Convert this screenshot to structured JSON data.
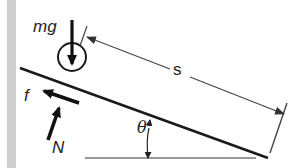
{
  "diagram": {
    "type": "inclined-plane free-body diagram",
    "colors": {
      "ink": "#1a1a1a",
      "dimension_line": "#444444",
      "ground_line": "#777777",
      "margin_band": "#cfcfcf"
    },
    "labels": {
      "weight": "mg",
      "friction": "f",
      "normal": "N",
      "distance": "s",
      "angle": "θ"
    },
    "elements": [
      {
        "id": "ball",
        "kind": "circle",
        "description": "Rolling object on incline"
      },
      {
        "id": "incline",
        "kind": "line",
        "description": "Inclined plane surface"
      },
      {
        "id": "ground",
        "kind": "line",
        "description": "Horizontal reference"
      },
      {
        "id": "weight-arrow",
        "kind": "arrow",
        "label": "mg",
        "direction": "down"
      },
      {
        "id": "friction-arrow",
        "kind": "arrow",
        "label": "f",
        "direction": "up-slope"
      },
      {
        "id": "normal-arrow",
        "kind": "arrow",
        "label": "N",
        "direction": "perpendicular to slope"
      },
      {
        "id": "distance-dimension",
        "kind": "dimension",
        "label": "s"
      },
      {
        "id": "angle-marker",
        "kind": "angle",
        "label": "θ"
      }
    ]
  }
}
